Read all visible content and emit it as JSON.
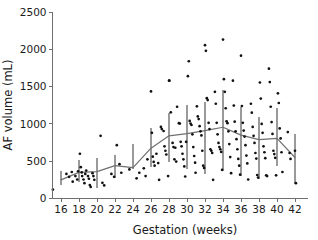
{
  "chart_data": {
    "type": "scatter",
    "title": "",
    "xlabel": "Gestation (weeks)",
    "ylabel": "AF volume (mL)",
    "xlim": [
      15,
      43
    ],
    "ylim": [
      0,
      2500
    ],
    "xticks": [
      16,
      18,
      20,
      22,
      24,
      26,
      28,
      30,
      32,
      34,
      36,
      38,
      40,
      42
    ],
    "yticks": [
      0,
      500,
      1000,
      1500,
      2000,
      2500
    ],
    "grid": false,
    "legend": null,
    "colors": {
      "points": "#111111",
      "trend_line": "#707070",
      "error_bars": "#9a9a9a",
      "axis": "#6e6e6e",
      "text": "#1a1a1a",
      "background": "#ffffff"
    },
    "series": [
      {
        "name": "AF volume observations",
        "marker": "filled-circle",
        "points": [
          [
            15.1,
            120
          ],
          [
            16.6,
            330
          ],
          [
            16.9,
            290
          ],
          [
            17.2,
            355
          ],
          [
            17.3,
            225
          ],
          [
            17.6,
            300
          ],
          [
            17.8,
            255
          ],
          [
            17.9,
            365
          ],
          [
            18.1,
            600
          ],
          [
            18.2,
            420
          ],
          [
            18.3,
            350
          ],
          [
            18.35,
            300
          ],
          [
            18.5,
            255
          ],
          [
            18.6,
            205
          ],
          [
            18.7,
            330
          ],
          [
            18.8,
            375
          ],
          [
            19.0,
            300
          ],
          [
            19.1,
            265
          ],
          [
            19.2,
            180
          ],
          [
            19.3,
            155
          ],
          [
            19.5,
            340
          ],
          [
            19.6,
            300
          ],
          [
            19.7,
            250
          ],
          [
            20.4,
            840
          ],
          [
            20.6,
            210
          ],
          [
            20.8,
            175
          ],
          [
            21.6,
            330
          ],
          [
            21.9,
            290
          ],
          [
            22.2,
            715
          ],
          [
            22.5,
            460
          ],
          [
            22.7,
            345
          ],
          [
            23.6,
            390
          ],
          [
            24.4,
            270
          ],
          [
            24.7,
            345
          ],
          [
            25.2,
            405
          ],
          [
            25.4,
            300
          ],
          [
            25.6,
            525
          ],
          [
            26.0,
            1435
          ],
          [
            26.1,
            880
          ],
          [
            26.2,
            560
          ],
          [
            26.3,
            490
          ],
          [
            26.4,
            440
          ],
          [
            26.6,
            600
          ],
          [
            26.8,
            475
          ],
          [
            26.9,
            250
          ],
          [
            27.1,
            960
          ],
          [
            27.2,
            930
          ],
          [
            27.4,
            905
          ],
          [
            27.5,
            700
          ],
          [
            27.6,
            640
          ],
          [
            27.7,
            590
          ],
          [
            27.9,
            300
          ],
          [
            28.0,
            1580
          ],
          [
            28.05,
            1580
          ],
          [
            28.2,
            1155
          ],
          [
            28.4,
            745
          ],
          [
            28.5,
            690
          ],
          [
            28.6,
            525
          ],
          [
            28.7,
            680
          ],
          [
            28.8,
            495
          ],
          [
            28.9,
            1230
          ],
          [
            29.1,
            1010
          ],
          [
            29.2,
            1005
          ],
          [
            29.3,
            760
          ],
          [
            29.4,
            700
          ],
          [
            29.5,
            600
          ],
          [
            29.6,
            525
          ],
          [
            29.7,
            430
          ],
          [
            29.8,
            295
          ],
          [
            29.9,
            760
          ],
          [
            30.1,
            1640
          ],
          [
            30.2,
            1840
          ],
          [
            30.3,
            1040
          ],
          [
            30.4,
            1005
          ],
          [
            30.5,
            985
          ],
          [
            30.6,
            860
          ],
          [
            30.7,
            690
          ],
          [
            30.8,
            570
          ],
          [
            30.9,
            480
          ],
          [
            30.95,
            345
          ],
          [
            31.1,
            1235
          ],
          [
            31.2,
            1100
          ],
          [
            31.3,
            1065
          ],
          [
            31.4,
            970
          ],
          [
            31.5,
            900
          ],
          [
            31.6,
            845
          ],
          [
            31.7,
            640
          ],
          [
            31.8,
            440
          ],
          [
            31.9,
            410
          ],
          [
            32.0,
            2055
          ],
          [
            32.1,
            1980
          ],
          [
            32.2,
            1345
          ],
          [
            32.3,
            1320
          ],
          [
            32.4,
            1015
          ],
          [
            32.5,
            930
          ],
          [
            32.6,
            660
          ],
          [
            32.7,
            640
          ],
          [
            32.8,
            610
          ],
          [
            32.9,
            250
          ],
          [
            33.1,
            1430
          ],
          [
            33.2,
            1270
          ],
          [
            33.3,
            1015
          ],
          [
            33.4,
            860
          ],
          [
            33.5,
            745
          ],
          [
            33.6,
            690
          ],
          [
            33.7,
            660
          ],
          [
            33.8,
            625
          ],
          [
            33.9,
            385
          ],
          [
            34.0,
            2130
          ],
          [
            34.1,
            1600
          ],
          [
            34.2,
            1430
          ],
          [
            34.3,
            1210
          ],
          [
            34.4,
            1035
          ],
          [
            34.5,
            1010
          ],
          [
            34.6,
            900
          ],
          [
            34.7,
            730
          ],
          [
            34.8,
            555
          ],
          [
            34.9,
            340
          ],
          [
            35.1,
            1580
          ],
          [
            35.2,
            1245
          ],
          [
            35.3,
            1030
          ],
          [
            35.4,
            900
          ],
          [
            35.5,
            795
          ],
          [
            35.6,
            660
          ],
          [
            35.7,
            530
          ],
          [
            35.8,
            440
          ],
          [
            35.9,
            320
          ],
          [
            36.0,
            1915
          ],
          [
            36.1,
            1240
          ],
          [
            36.2,
            1015
          ],
          [
            36.3,
            910
          ],
          [
            36.4,
            830
          ],
          [
            36.5,
            715
          ],
          [
            36.6,
            575
          ],
          [
            36.7,
            470
          ],
          [
            36.8,
            255
          ],
          [
            37.1,
            1270
          ],
          [
            37.2,
            1150
          ],
          [
            37.3,
            960
          ],
          [
            37.4,
            840
          ],
          [
            37.5,
            745
          ],
          [
            37.6,
            610
          ],
          [
            37.7,
            535
          ],
          [
            37.8,
            315
          ],
          [
            37.9,
            280
          ],
          [
            38.1,
            1555
          ],
          [
            38.2,
            1340
          ],
          [
            38.3,
            1000
          ],
          [
            38.4,
            880
          ],
          [
            38.5,
            700
          ],
          [
            38.6,
            620
          ],
          [
            38.7,
            540
          ],
          [
            38.8,
            310
          ],
          [
            38.9,
            300
          ],
          [
            39.1,
            1740
          ],
          [
            39.2,
            1560
          ],
          [
            39.3,
            1230
          ],
          [
            39.4,
            1025
          ],
          [
            39.5,
            865
          ],
          [
            39.6,
            640
          ],
          [
            39.7,
            595
          ],
          [
            39.8,
            545
          ],
          [
            39.9,
            310
          ],
          [
            40.1,
            1410
          ],
          [
            40.2,
            1280
          ],
          [
            40.3,
            940
          ],
          [
            40.4,
            805
          ],
          [
            40.5,
            620
          ],
          [
            40.6,
            355
          ],
          [
            41.2,
            890
          ],
          [
            41.4,
            610
          ],
          [
            41.5,
            530
          ],
          [
            42.0,
            640
          ],
          [
            42.1,
            205
          ]
        ]
      }
    ],
    "trend_line": {
      "name": "Mean AF volume",
      "x": [
        16,
        18,
        20,
        22,
        24,
        26,
        28,
        30,
        32,
        34,
        36,
        38,
        40,
        42
      ],
      "y": [
        250,
        350,
        360,
        440,
        415,
        675,
        840,
        870,
        910,
        955,
        850,
        790,
        805,
        550
      ]
    },
    "error_bars": [
      {
        "x": 16,
        "low": 175,
        "high": 370
      },
      {
        "x": 18,
        "low": 215,
        "high": 520
      },
      {
        "x": 20,
        "low": 140,
        "high": 545
      },
      {
        "x": 22,
        "low": 275,
        "high": 580
      },
      {
        "x": 24,
        "low": 390,
        "high": 735
      },
      {
        "x": 26,
        "low": 420,
        "high": 945
      },
      {
        "x": 28,
        "low": 490,
        "high": 1150
      },
      {
        "x": 30,
        "low": 400,
        "high": 1260
      },
      {
        "x": 32,
        "low": 325,
        "high": 1290
      },
      {
        "x": 34,
        "low": 370,
        "high": 1455
      },
      {
        "x": 36,
        "low": 300,
        "high": 1220
      },
      {
        "x": 38,
        "low": 265,
        "high": 1090
      },
      {
        "x": 40,
        "low": 440,
        "high": 1215
      },
      {
        "x": 42,
        "low": 195,
        "high": 860
      }
    ]
  }
}
